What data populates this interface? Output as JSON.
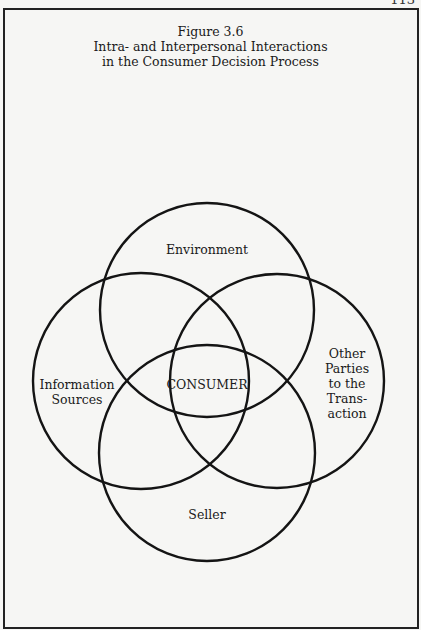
{
  "page_number": "113",
  "figure": {
    "number": "Figure 3.6",
    "title_line1": "Intra- and Interpersonal Interactions",
    "title_line2": "in the Consumer Decision Process"
  },
  "diagram": {
    "type": "venn",
    "center_label": "CONSUMER",
    "circles": [
      {
        "id": "environment",
        "label": "Environment",
        "cx": 207,
        "cy": 310,
        "r": 107
      },
      {
        "id": "information-sources",
        "label_line1": "Information",
        "label_line2": "Sources",
        "cx": 141,
        "cy": 381,
        "r": 108
      },
      {
        "id": "other-parties",
        "label_line1": "Other",
        "label_line2": "Parties",
        "label_line3": "to the",
        "label_line4": "Trans-",
        "label_line5": "action",
        "cx": 277,
        "cy": 381,
        "r": 107
      },
      {
        "id": "seller",
        "label": "Seller",
        "cx": 207,
        "cy": 453,
        "r": 108
      }
    ],
    "stroke_color": "#141414"
  }
}
